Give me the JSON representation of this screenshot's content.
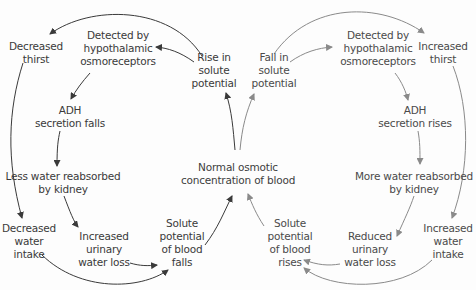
{
  "colors": {
    "left_loop": "#3a3a3a",
    "right_loop": "#8a8a8a",
    "text_left": "#3a3a3a",
    "text_right": "#4a4a4a"
  },
  "center": {
    "label": "Normal osmotic\nconcentration of blood"
  },
  "left_loop": {
    "rise": "Rise in\nsolute\npotential",
    "detected": "Detected by\nhypothalamic\nosmoreceptors",
    "thirst": "Decreased\nthirst",
    "adh": "ADH\nsecretion falls",
    "kidney": "Less water reabsorbed\nby kidney",
    "intake": "Decreased\nwater\nintake",
    "urine": "Increased\nurinary\nwater loss",
    "result": "Solute\npotential\nof blood\nfalls"
  },
  "right_loop": {
    "fall": "Fall in\nsolute\npotential",
    "detected": "Detected by\nhypothalamic\nosmoreceptors",
    "thirst": "Increased\nthirst",
    "adh": "ADH\nsecretion rises",
    "kidney": "More water reabsorbed\nby kidney",
    "intake": "Increased\nwater\nintake",
    "urine": "Reduced\nurinary\nwater loss",
    "result": "Solute\npotential\nof blood\nrises"
  }
}
